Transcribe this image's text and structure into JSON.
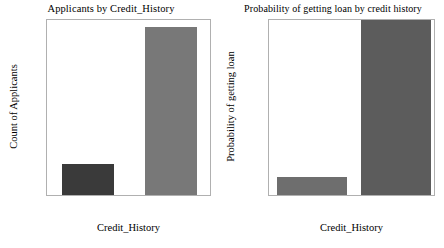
{
  "figure": {
    "width": 444,
    "height": 248,
    "background": "#ffffff"
  },
  "chart_data": [
    {
      "type": "bar",
      "id": "applicants-by-credit-history",
      "title": "Applicants by Credit_History",
      "xlabel": "Credit_History",
      "ylabel": "Count of Applicants",
      "categories": [
        "0.0",
        "0.1"
      ],
      "x": [
        0.0,
        0.1
      ],
      "values": [
        89,
        475
      ],
      "bar_colors": [
        "#3a3a3a",
        "#787878"
      ],
      "xlim": [
        -0.05,
        0.15
      ],
      "ylim": [
        0,
        500
      ],
      "xticks": [
        "0.0",
        "0.1"
      ],
      "yticks": [
        "0",
        "100",
        "200",
        "300",
        "400"
      ],
      "ytick_values": [
        0,
        100,
        200,
        300,
        400
      ],
      "grid": false,
      "legend": "none"
    },
    {
      "type": "bar",
      "id": "probability-of-loan-by-credit-history",
      "title": "Probability of getting loan by credit history",
      "xlabel": "Credit_History",
      "ylabel": "Probability of getting loan",
      "categories": [
        "0.0",
        "1.0"
      ],
      "x": [
        0.0,
        1.0
      ],
      "values": [
        0.08,
        0.795
      ],
      "bar_colors": [
        "#6e6e6e",
        "#5c5c5c"
      ],
      "xlim": [
        -0.5,
        1.5
      ],
      "ylim": [
        0.0,
        0.8
      ],
      "xticks": [
        "0.0",
        "0.5",
        "1.0"
      ],
      "xtick_values": [
        0.0,
        0.5,
        1.0
      ],
      "yticks": [
        "0.0",
        "0.1",
        "0.2",
        "0.3",
        "0.4",
        "0.5",
        "0.6",
        "0.7",
        "0.8"
      ],
      "ytick_values": [
        0.0,
        0.1,
        0.2,
        0.3,
        0.4,
        0.5,
        0.6,
        0.7,
        0.8
      ],
      "grid": false,
      "legend": "none"
    }
  ],
  "colors": {
    "axis": "#b0b0b0",
    "tick": "#909090",
    "text": "#000000",
    "background": "#ffffff"
  }
}
